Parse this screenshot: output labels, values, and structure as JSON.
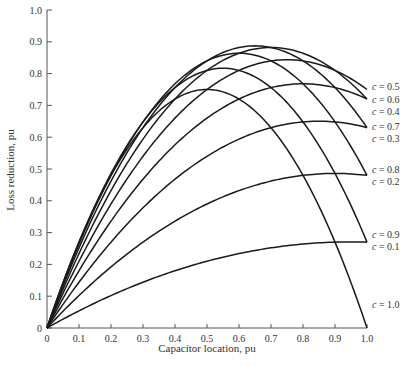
{
  "chart_data": {
    "type": "line",
    "title": "",
    "xlabel": "Capacitor location, pu",
    "ylabel": "Loss reduction, pu",
    "xlim": [
      0,
      1.0
    ],
    "ylim": [
      0,
      1.0
    ],
    "grid": false,
    "x_ticks": [
      "0",
      "0.1",
      "0.2",
      "0.3",
      "0.4",
      "0.5",
      "0.6",
      "0.7",
      "0.8",
      "0.9",
      "1.0"
    ],
    "y_ticks": [
      "0",
      "0.1",
      "0.2",
      "0.3",
      "0.4",
      "0.5",
      "0.6",
      "0.7",
      "0.8",
      "0.9",
      "1.0"
    ],
    "x": [
      0,
      0.1,
      0.2,
      0.3,
      0.4,
      0.5,
      0.6,
      0.7,
      0.8,
      0.9,
      1.0
    ],
    "series": [
      {
        "name": "c = 0.1",
        "c": 0.1,
        "values": [
          0,
          0.054,
          0.102,
          0.144,
          0.18,
          0.21,
          0.234,
          0.252,
          0.264,
          0.27,
          0.27
        ]
      },
      {
        "name": "c = 0.2",
        "c": 0.2,
        "values": [
          0,
          0.102,
          0.192,
          0.27,
          0.336,
          0.39,
          0.432,
          0.462,
          0.48,
          0.486,
          0.48
        ]
      },
      {
        "name": "c = 0.3",
        "c": 0.3,
        "values": [
          0,
          0.144,
          0.27,
          0.378,
          0.468,
          0.54,
          0.594,
          0.63,
          0.648,
          0.648,
          0.63
        ]
      },
      {
        "name": "c = 0.4",
        "c": 0.4,
        "values": [
          0,
          0.18,
          0.336,
          0.468,
          0.576,
          0.66,
          0.72,
          0.756,
          0.768,
          0.756,
          0.72
        ]
      },
      {
        "name": "c = 0.5",
        "c": 0.5,
        "values": [
          0,
          0.21,
          0.39,
          0.54,
          0.66,
          0.75,
          0.81,
          0.84,
          0.84,
          0.81,
          0.75
        ]
      },
      {
        "name": "c = 0.6",
        "c": 0.6,
        "values": [
          0,
          0.234,
          0.432,
          0.594,
          0.72,
          0.81,
          0.864,
          0.882,
          0.864,
          0.81,
          0.72
        ]
      },
      {
        "name": "c = 0.7",
        "c": 0.7,
        "values": [
          0,
          0.252,
          0.462,
          0.63,
          0.756,
          0.84,
          0.882,
          0.882,
          0.84,
          0.756,
          0.63
        ]
      },
      {
        "name": "c = 0.8",
        "c": 0.8,
        "values": [
          0,
          0.264,
          0.48,
          0.648,
          0.768,
          0.84,
          0.864,
          0.84,
          0.768,
          0.648,
          0.48
        ]
      },
      {
        "name": "c = 0.9",
        "c": 0.9,
        "values": [
          0,
          0.27,
          0.486,
          0.648,
          0.756,
          0.81,
          0.81,
          0.756,
          0.648,
          0.486,
          0.27
        ]
      },
      {
        "name": "c = 1.0",
        "c": 1.0,
        "values": [
          0,
          0.27,
          0.48,
          0.63,
          0.72,
          0.75,
          0.72,
          0.63,
          0.48,
          0.27,
          0
        ]
      }
    ],
    "annotations": [
      {
        "text": "c = 0.5",
        "y": 0.76
      },
      {
        "text": "c = 0.6",
        "y": 0.72
      },
      {
        "text": "c = 0.4",
        "y": 0.68
      },
      {
        "text": "c = 0.7",
        "y": 0.635
      },
      {
        "text": "c = 0.3",
        "y": 0.595
      },
      {
        "text": "c = 0.8",
        "y": 0.5
      },
      {
        "text": "c = 0.2",
        "y": 0.46
      },
      {
        "text": "c = 0.9",
        "y": 0.295
      },
      {
        "text": "c = 0.1",
        "y": 0.255
      },
      {
        "text": "c = 1.0",
        "y": 0.075
      }
    ],
    "legend_position": "none (inline labels at right edge)"
  }
}
